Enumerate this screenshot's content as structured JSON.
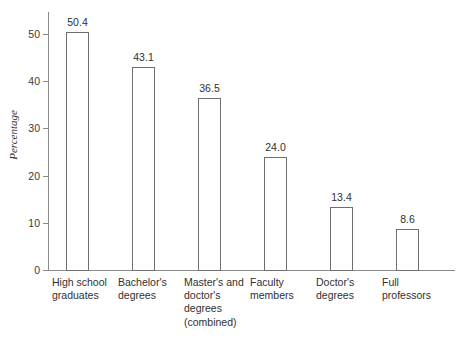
{
  "chart": {
    "y_axis_title": "Percentage",
    "y_ticks": [
      "0",
      "10",
      "20",
      "30",
      "40",
      "50"
    ],
    "footnote": ""
  },
  "chart_data": {
    "type": "bar",
    "title": "",
    "xlabel": "",
    "ylabel": "Percentage",
    "ylim": [
      0,
      55
    ],
    "yticks": [
      0,
      10,
      20,
      30,
      40,
      50
    ],
    "grid": false,
    "legend": "none",
    "categories": [
      "High school graduates",
      "Bachelor's degrees",
      "Master's and doctor's degrees (combined)",
      "Faculty members",
      "Doctor's degrees",
      "Full professors"
    ],
    "category_lines": [
      [
        "High school",
        "graduates"
      ],
      [
        "Bachelor's",
        "degrees"
      ],
      [
        "Master's and",
        "doctor's",
        "degrees",
        "(combined)"
      ],
      [
        "Faculty",
        "members"
      ],
      [
        "Doctor's",
        "degrees"
      ],
      [
        "Full",
        "professors"
      ]
    ],
    "values": [
      50.4,
      43.1,
      36.5,
      24.0,
      13.4,
      8.6
    ],
    "value_labels": [
      "50.4",
      "43.1",
      "36.5",
      "24.0",
      "13.4",
      "8.6"
    ],
    "bar_style": {
      "fill": "#ffffff",
      "edge": "#6f6f6f"
    }
  }
}
